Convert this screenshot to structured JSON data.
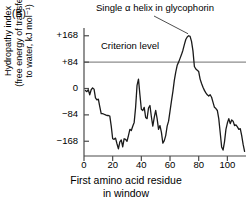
{
  "panel": {
    "label": "(B)"
  },
  "annotations": {
    "helix_line1": "Single α helix",
    "helix_line2": "in glycophorin",
    "criterion": "Criterion level"
  },
  "axes": {
    "ylabel_line1": "Hydropathy index",
    "ylabel_line2": "(free energy of transfer",
    "ylabel_line3": "to water, kJ mol⁻¹)",
    "xlabel_line1": "First amino acid residue",
    "xlabel_line2": "in window"
  },
  "colors": {
    "curve": "#1a1a1a",
    "axis": "#4a4a4a",
    "criterion_line": "#8c8c8c",
    "text": "#000000",
    "background": "#ffffff"
  },
  "chart_data": {
    "type": "line",
    "title": "",
    "subtitle": "",
    "xlabel": "First amino acid residue in window",
    "ylabel": "Hydropathy index (free energy of transfer to water, kJ mol⁻¹)",
    "xlim": [
      0,
      113
    ],
    "ylim": [
      -215,
      180
    ],
    "xticks": [
      0,
      20,
      40,
      60,
      80,
      100
    ],
    "yticks": [
      -168,
      -84,
      0,
      84,
      168
    ],
    "ytick_labels": [
      "−168",
      "−84",
      "0",
      "+84",
      "+168"
    ],
    "xtick_labels": [
      "0",
      "20",
      "40",
      "60",
      "80",
      "100"
    ],
    "grid": false,
    "legend": null,
    "annotations": [
      {
        "text": "Single α helix in glycophorin",
        "x": 74,
        "y": 168,
        "pointer": true
      },
      {
        "text": "Criterion level",
        "x": 22,
        "y": 84,
        "pointer": false
      }
    ],
    "reference_lines": [
      {
        "name": "criterion-level",
        "y": 84,
        "color": "#8c8c8c",
        "label": "Criterion level"
      }
    ],
    "series": [
      {
        "name": "Glycophorin hydropathy",
        "x": [
          1,
          2,
          3,
          4,
          5,
          6,
          7,
          8,
          9,
          10,
          11,
          12,
          13,
          14,
          15,
          16,
          17,
          18,
          19,
          20,
          21,
          22,
          23,
          24,
          25,
          26,
          27,
          28,
          29,
          30,
          31,
          32,
          33,
          34,
          35,
          36,
          37,
          38,
          39,
          40,
          41,
          42,
          43,
          44,
          45,
          46,
          47,
          48,
          49,
          50,
          51,
          52,
          53,
          54,
          55,
          56,
          57,
          58,
          59,
          60,
          61,
          62,
          63,
          64,
          65,
          66,
          67,
          68,
          69,
          70,
          71,
          72,
          73,
          74,
          75,
          76,
          77,
          78,
          79,
          80,
          81,
          82,
          83,
          84,
          85,
          86,
          87,
          88,
          89,
          90,
          91,
          92,
          93,
          94,
          95,
          96,
          97,
          98,
          99,
          100,
          101,
          102,
          103,
          104,
          105,
          106,
          107,
          108,
          109,
          110,
          111,
          112
        ],
        "values": [
          -6,
          -10,
          -4,
          -20,
          -4,
          2,
          -2,
          -30,
          -36,
          -34,
          -58,
          -80,
          -80,
          -82,
          -84,
          -86,
          -86,
          -88,
          -120,
          -160,
          -162,
          -158,
          -176,
          -192,
          -170,
          -164,
          -186,
          -160,
          -162,
          -168,
          -150,
          -130,
          -134,
          -120,
          -108,
          -60,
          10,
          30,
          -20,
          -66,
          -70,
          -60,
          -92,
          -96,
          -62,
          -54,
          -90,
          -120,
          -92,
          -70,
          -96,
          -130,
          -118,
          -140,
          -174,
          -166,
          -150,
          -120,
          -104,
          -72,
          -40,
          -10,
          26,
          52,
          74,
          84,
          96,
          108,
          122,
          140,
          156,
          164,
          168,
          166,
          150,
          120,
          70,
          62,
          58,
          54,
          30,
          16,
          4,
          -6,
          -14,
          -20,
          -24,
          -20,
          -28,
          -44,
          -60,
          -64,
          -70,
          -96,
          -140,
          -186,
          -196,
          -170,
          -130,
          -110,
          -96,
          -112,
          -100,
          -104,
          -118,
          -116,
          -122,
          -130,
          -128,
          -150,
          -178,
          -200
        ]
      }
    ]
  }
}
